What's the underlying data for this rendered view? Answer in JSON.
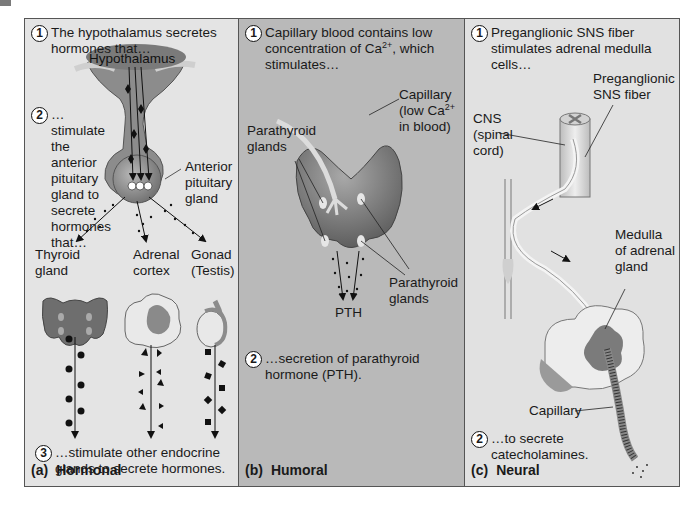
{
  "figure": {
    "panels": [
      {
        "id": "a",
        "caption_letter": "(a)",
        "caption_title": "Hormonal",
        "steps": [
          {
            "num": "1",
            "text": "The hypothalamus secretes hormones that…"
          },
          {
            "num": "2",
            "text": "…stimulate the anterior pituitary gland to secrete hormones that…"
          },
          {
            "num": "3",
            "text": "…stimulate other endocrine glands to secrete hormones."
          }
        ],
        "labels": {
          "hypothalamus": "Hypothalamus",
          "anterior_pituitary": "Anterior pituitary gland",
          "thyroid": "Thyroid gland",
          "adrenal_cortex": "Adrenal cortex",
          "gonad": "Gonad (Testis)"
        }
      },
      {
        "id": "b",
        "caption_letter": "(b)",
        "caption_title": "Humoral",
        "steps": [
          {
            "num": "1",
            "text_pre": "Capillary blood contains low concentration of Ca",
            "sup": "2+",
            "text_post": ", which stimulates…"
          },
          {
            "num": "2",
            "text": "…secretion of parathyroid hormone (PTH)."
          }
        ],
        "labels": {
          "capillary_pre": "Capillary (low Ca",
          "capillary_sup": "2+",
          "capillary_post": " in blood)",
          "parathyroid_left": "Parathyroid glands",
          "parathyroid_right": "Parathyroid glands",
          "pth": "PTH"
        }
      },
      {
        "id": "c",
        "caption_letter": "(c)",
        "caption_title": "Neural",
        "steps": [
          {
            "num": "1",
            "text": "Preganglionic SNS fiber stimulates adrenal medulla cells…"
          },
          {
            "num": "2",
            "text": "…to secrete catecholamines."
          }
        ],
        "labels": {
          "preganglionic": "Preganglionic SNS fiber",
          "cns": "CNS (spinal cord)",
          "medulla": "Medulla of adrenal gland",
          "capillary": "Capillary"
        }
      }
    ],
    "colors": {
      "panel_a_bg": "#e4e4e4",
      "panel_b_bg": "#b9b9b9",
      "panel_c_bg": "#e1e1e1",
      "gland_dark": "#6e6e6e",
      "gland_mid": "#9a9a9a",
      "gland_light": "#d8d8d8"
    }
  }
}
